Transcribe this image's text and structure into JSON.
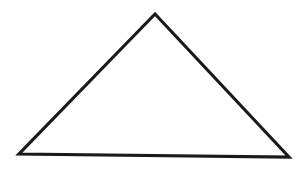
{
  "diagram": {
    "shape": "triangle",
    "fill_color": "#ffffff",
    "stroke_color": "#1a1a1a",
    "vertices": [
      "apex",
      "bottom-left",
      "bottom-right"
    ]
  }
}
